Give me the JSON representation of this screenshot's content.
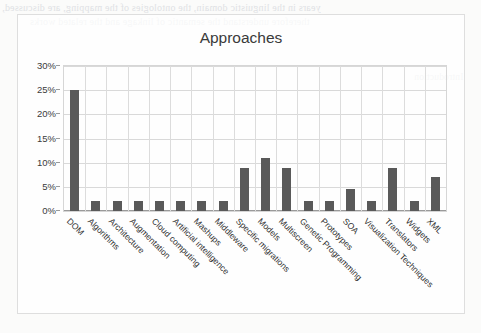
{
  "document": {
    "background_bleed_lines": [
      "years in the linguistic domain, the ontologies of the mapping, are discussed,",
      "therefore understand the semantic of linkage and the related works"
    ],
    "faint_marginalia": [
      "Introduction",
      "Evaluation"
    ]
  },
  "chart_data": {
    "type": "bar",
    "title": "Approaches",
    "xlabel": "",
    "ylabel": "",
    "ylim": [
      0,
      30
    ],
    "ytick_labels": [
      "0%",
      "5%",
      "10%",
      "15%",
      "20%",
      "25%",
      "30%"
    ],
    "ytick_values": [
      0,
      5,
      10,
      15,
      20,
      25,
      30
    ],
    "grid": true,
    "legend": false,
    "bar_color": "#595959",
    "plot_border_color": "#d6d6d6",
    "categories": [
      "DOM",
      "Algorithms",
      "Architecture",
      "Augmentation",
      "Cloud computing",
      "Artificial intelligence",
      "Mashups",
      "Middleware",
      "Specific migrations",
      "Models",
      "Multiscreen",
      "Genetic Programming",
      "Prototypes",
      "SOA",
      "Visualization Techniques",
      "Translators",
      "Widgets",
      "XML"
    ],
    "values": [
      25,
      2,
      2,
      2,
      2,
      2,
      2,
      2,
      9,
      11,
      9,
      2,
      2,
      4.5,
      2,
      9,
      2,
      7
    ],
    "value_labels": [
      "25%",
      "2%",
      "2%",
      "2%",
      "2%",
      "2%",
      "2%",
      "2%",
      "9%",
      "11%",
      "9%",
      "2%",
      "2%",
      "4.5%",
      "2%",
      "9%",
      "2%",
      "7%"
    ]
  }
}
